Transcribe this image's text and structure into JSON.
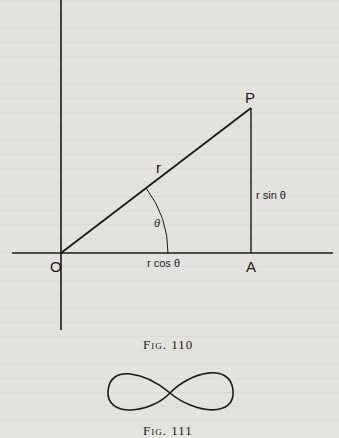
{
  "figure110": {
    "caption": "Fig. 110",
    "points": {
      "origin": "O",
      "point_p": "P",
      "point_a": "A"
    },
    "labels": {
      "radius": "r",
      "angle": "θ",
      "x_component": "r cos θ",
      "y_component": "r sin θ"
    },
    "geometry": {
      "origin": [
        61,
        253
      ],
      "p": [
        251,
        108
      ],
      "a": [
        251,
        253
      ],
      "arc_radius": 107
    }
  },
  "figure111": {
    "caption": "Fig. 111",
    "shape": "lemniscate"
  },
  "colors": {
    "ink": "#1a1a1a",
    "paper": "#e4e2de"
  }
}
